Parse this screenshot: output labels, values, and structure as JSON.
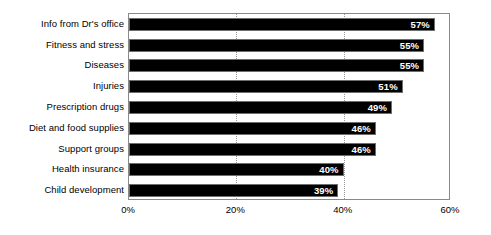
{
  "chart_data": {
    "type": "bar",
    "orientation": "horizontal",
    "title": "",
    "subtitle": "",
    "xlabel": "",
    "ylabel": "",
    "xlim": [
      0,
      60
    ],
    "grid": true,
    "gridlines": [
      20,
      40
    ],
    "legend": "none",
    "unit": "%",
    "categories": [
      "Info from Dr's office",
      "Fitness and stress",
      "Diseases",
      "Injuries",
      "Prescription drugs",
      "Diet and food supplies",
      "Support groups",
      "Health insurance",
      "Child development"
    ],
    "values": [
      57,
      55,
      55,
      51,
      49,
      46,
      46,
      40,
      39
    ],
    "data_labels": [
      "57%",
      "55%",
      "55%",
      "51%",
      "49%",
      "46%",
      "46%",
      "40%",
      "39%"
    ],
    "x_ticks": [
      0,
      20,
      40,
      60
    ],
    "x_tick_labels": [
      "0%",
      "20%",
      "40%",
      "60%"
    ],
    "colors": {
      "bar_fill": "#000000",
      "bar_border": "#6e6e6e",
      "data_label": "#ffffff",
      "plot_border": "#8a8a8a",
      "gridline": "#999999",
      "background": "#ffffff",
      "text": "#000000"
    }
  }
}
